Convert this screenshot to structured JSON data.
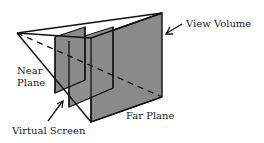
{
  "diagram": {
    "labels": {
      "view_volume": "View Volume",
      "near_plane_line1": "Near",
      "near_plane_line2": "Plane",
      "virtual_screen": "Virtual Screen",
      "far_plane": "Far Plane"
    },
    "colors": {
      "plane_fill": "#8a8a8a",
      "stroke": "#111111",
      "background": "#ffffff"
    }
  }
}
